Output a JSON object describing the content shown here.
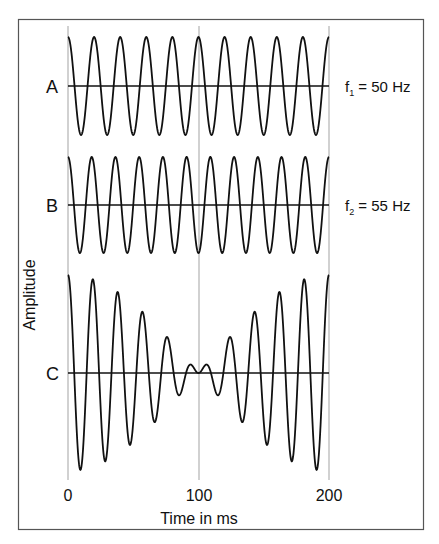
{
  "chart_data": {
    "type": "line",
    "title": "",
    "xlabel": "Time in ms",
    "ylabel": "Amplitude",
    "xlim": [
      0,
      200
    ],
    "x_ticks": [
      0,
      100,
      200
    ],
    "x_tick_labels": [
      "0",
      "100",
      "200"
    ],
    "grid": {
      "vertical_lines_at": [
        0,
        100,
        200
      ],
      "horizontal": false
    },
    "series": [
      {
        "name": "A",
        "label": "A",
        "frequency_hz": 50,
        "annotation": "f1 = 50 Hz",
        "annotation_sub": "1",
        "amplitude": 1,
        "function": "cos(2π·50·t)",
        "baseline_y": 86,
        "amp_px": 49
      },
      {
        "name": "B",
        "label": "B",
        "frequency_hz": 55,
        "annotation": "f2 = 55 Hz",
        "annotation_sub": "2",
        "amplitude": 1,
        "function": "cos(2π·55·t)",
        "baseline_y": 205,
        "amp_px": 48
      },
      {
        "name": "C",
        "label": "C",
        "frequency_hz": null,
        "annotation": "",
        "amplitude": 2,
        "function": "cos(2π·50·t) + cos(2π·55·t) (beat, envelope min at 100 ms)",
        "baseline_y": 373,
        "amp_px": 49
      }
    ]
  },
  "labels": {
    "ylabel": "Amplitude",
    "xlabel": "Time in ms",
    "tick0": "0",
    "tick100": "100",
    "tick200": "200",
    "rowA": "A",
    "rowB": "B",
    "rowC": "C",
    "f1_prefix": "f",
    "f1_sub": "1",
    "f1_rest": " = 50 Hz",
    "f2_prefix": "f",
    "f2_sub": "2",
    "f2_rest": " = 55 Hz"
  },
  "colors": {
    "frame": "#555555",
    "grid": "#999999",
    "trace": "#111111",
    "background": "#ffffff"
  }
}
